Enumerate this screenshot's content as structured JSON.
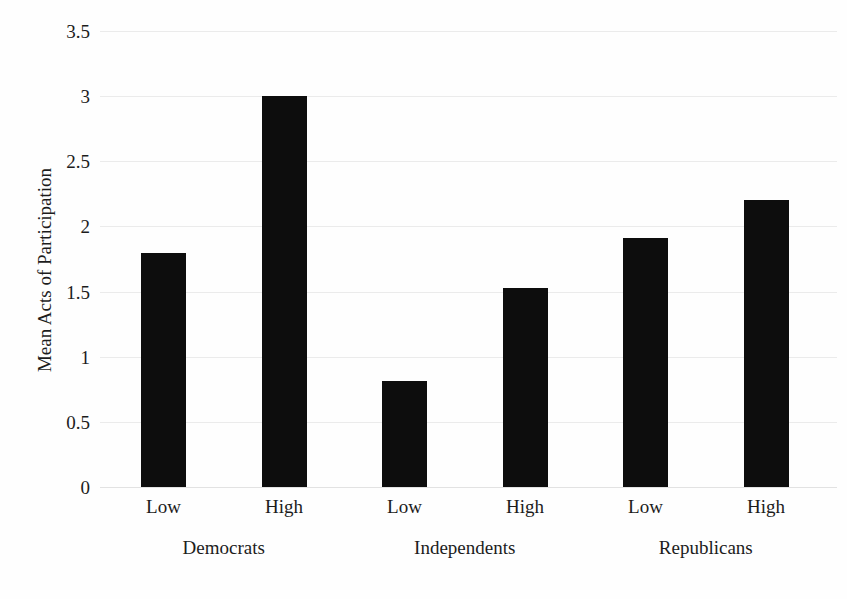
{
  "chart_data": {
    "type": "bar",
    "title": "",
    "subtitle": "",
    "xlabel": "",
    "ylabel": "Mean Acts of Participation",
    "ylim": [
      0,
      3.5
    ],
    "ytick_values": [
      0,
      0.5,
      1,
      1.5,
      2,
      2.5,
      3,
      3.5
    ],
    "ytick_labels": [
      "0",
      "0.5",
      "1",
      "1.5",
      "2",
      "2.5",
      "3",
      "3.5"
    ],
    "grid": true,
    "grid_axis": "y",
    "legend": false,
    "legend_position": "none",
    "bar_color": "#0d0d0d",
    "background_color": "#fefefe",
    "categories": [
      "Low",
      "High",
      "Low",
      "High",
      "Low",
      "High"
    ],
    "values": [
      1.8,
      3.0,
      0.81,
      1.53,
      1.91,
      2.2
    ],
    "groups": [
      {
        "label": "Democrats",
        "bars": [
          {
            "label": "Low",
            "value": 1.8
          },
          {
            "label": "High",
            "value": 3.0
          }
        ]
      },
      {
        "label": "Independents",
        "bars": [
          {
            "label": "Low",
            "value": 0.81
          },
          {
            "label": "High",
            "value": 1.53
          }
        ]
      },
      {
        "label": "Republicans",
        "bars": [
          {
            "label": "Low",
            "value": 1.91
          },
          {
            "label": "High",
            "value": 2.2
          }
        ]
      }
    ]
  }
}
